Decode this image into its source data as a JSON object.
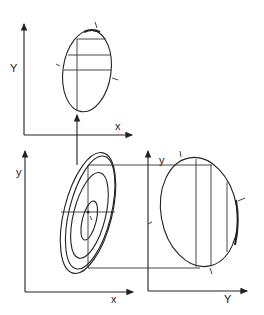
{
  "diagram": {
    "type": "marginal-projection-of-bivariate-distribution",
    "panels": [
      {
        "id": "top",
        "x_axis_label": "x",
        "y_axis_label": "Y",
        "description": "Single tilted ellipse with three horizontal slice lines and a vertical line; arrow from below"
      },
      {
        "id": "bottom-left",
        "x_axis_label": "x",
        "y_axis_label": "y",
        "description": "Four concentric tilted ellipses (contours) with center marker, crosshair lines"
      },
      {
        "id": "bottom-right",
        "x_axis_label": "Y",
        "y_axis_label": "y",
        "description": "Single ellipse with three vertical slice lines; projection lines from left panel"
      }
    ],
    "colors": {
      "ink": "#222222",
      "background": "#ffffff"
    }
  }
}
